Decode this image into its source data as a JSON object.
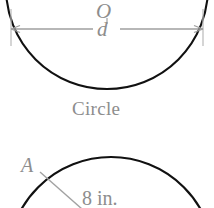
{
  "figure": {
    "title": "Circle",
    "kind": "geometry-diagram",
    "colors": {
      "outline": "#000000",
      "annotation": "#8d8d8d",
      "background": "#ffffff"
    }
  },
  "top_figure": {
    "name": "circle-with-diameter",
    "caption": "Circle",
    "center_label": "O",
    "diameter_label": "d",
    "dimension_line": {
      "left_tick_x": 11,
      "right_tick_x": 203,
      "line_y": 29
    },
    "circle": {
      "cx": 107,
      "cy": -12,
      "r": 101
    }
  },
  "bottom_figure": {
    "name": "circle-with-radius",
    "center_label": "A",
    "radius_label": "8 in.",
    "circle": {
      "cx": 111,
      "cy": 260,
      "r": 103
    },
    "radius_line": {
      "x1": 40,
      "y1": 173,
      "x2": 80,
      "y2": 208
    }
  }
}
